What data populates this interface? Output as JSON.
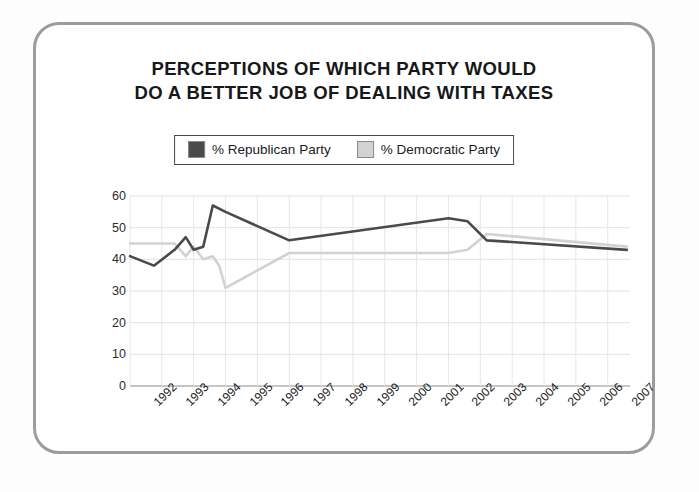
{
  "chart_data": {
    "type": "line",
    "title": "PERCEPTIONS OF WHICH PARTY WOULD DO A BETTER JOB OF DEALING WITH TAXES",
    "title_line1": "PERCEPTIONS OF WHICH PARTY WOULD",
    "title_line2": "DO A BETTER JOB OF DEALING WITH TAXES",
    "xlabel": "",
    "ylabel": "",
    "ylim": [
      0,
      60
    ],
    "yticks": [
      0,
      10,
      20,
      30,
      40,
      50,
      60
    ],
    "xlim": [
      1992,
      2007.7
    ],
    "grid": true,
    "legend_position": "top-center",
    "categories": [
      "1992",
      "1993",
      "1994",
      "1995",
      "1996",
      "1997",
      "1998",
      "1999",
      "2000",
      "2001",
      "2002",
      "2003",
      "2004",
      "2005",
      "2006",
      "2007"
    ],
    "series": [
      {
        "name": "% Republican Party",
        "color": "#4a4a4a",
        "x": [
          1992.0,
          1992.75,
          1993.4,
          1993.75,
          1994.0,
          1994.3,
          1994.6,
          1995.0,
          1997.0,
          2002.0,
          2002.6,
          2003.2,
          2007.6
        ],
        "values": [
          41,
          38,
          43,
          47,
          43,
          44,
          57,
          55,
          46,
          53,
          52,
          46,
          43
        ]
      },
      {
        "name": "% Democratic Party",
        "color": "#d2d2d2",
        "x": [
          1992.0,
          1993.4,
          1993.75,
          1994.0,
          1994.3,
          1994.6,
          1994.8,
          1995.0,
          1997.0,
          2002.0,
          2002.6,
          2003.2,
          2007.6
        ],
        "values": [
          45,
          45,
          41,
          44,
          40,
          41,
          38,
          31,
          42,
          42,
          43,
          48,
          44
        ]
      }
    ]
  },
  "legend": {
    "items": [
      {
        "label": "% Republican Party",
        "color": "#4a4a4a"
      },
      {
        "label": "% Democratic Party",
        "color": "#d2d2d2"
      }
    ]
  }
}
